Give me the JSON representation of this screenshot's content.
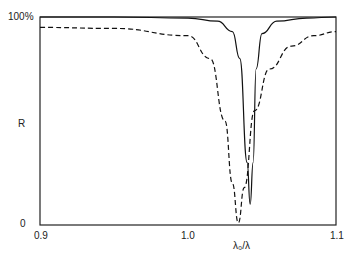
{
  "chart_data": {
    "type": "line",
    "title": "",
    "xlabel": "λ₀/λ",
    "ylabel": "R",
    "xlim": [
      0.9,
      1.1
    ],
    "ylim": [
      0,
      100
    ],
    "x_ticks": [
      "0.9",
      "1.0",
      "1.1"
    ],
    "y_ticks": [
      "0",
      "100%"
    ],
    "grid": false,
    "legend": null,
    "series": [
      {
        "name": "solid",
        "style": "solid",
        "x": [
          0.9,
          0.95,
          1.0,
          1.02,
          1.03,
          1.035,
          1.04,
          1.042,
          1.044,
          1.046,
          1.05,
          1.06,
          1.08,
          1.1
        ],
        "y": [
          100,
          100,
          99.5,
          98,
          93,
          80,
          30,
          10,
          30,
          75,
          92,
          98,
          99.5,
          100
        ]
      },
      {
        "name": "dashed",
        "style": "dashed",
        "x": [
          0.9,
          0.95,
          1.0,
          1.015,
          1.025,
          1.03,
          1.034,
          1.038,
          1.045,
          1.055,
          1.07,
          1.085,
          1.1
        ],
        "y": [
          95,
          94.5,
          91,
          80,
          50,
          20,
          1,
          18,
          55,
          75,
          86,
          91,
          93
        ]
      }
    ]
  },
  "labels": {
    "y_top": "100%",
    "y_bottom": "0",
    "y_axis": "R",
    "x_left": "0.9",
    "x_mid": "1.0",
    "x_right": "1.1",
    "x_axis": "λ₀/λ"
  }
}
